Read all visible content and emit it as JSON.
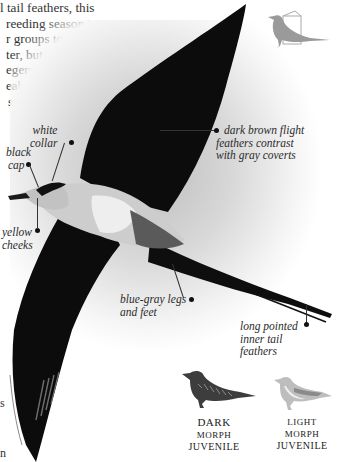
{
  "intro_text": {
    "lines": [
      "l tail feathers, this",
      "reeding season in",
      "r groups to the",
      "ter, but their",
      "egers, it is",
      "eabirds",
      "small"
    ]
  },
  "edge_fragments": [
    "s",
    "n"
  ],
  "annotations": {
    "white_collar": [
      "white",
      "collar"
    ],
    "black_cap": [
      "black",
      "cap"
    ],
    "yellow_cheeks": [
      "yellow",
      "cheeks"
    ],
    "flight_feathers": [
      "dark brown flight",
      "feathers contrast",
      "with gray coverts"
    ],
    "legs": [
      "blue-gray legs",
      "and feet"
    ],
    "tail": [
      "long pointed",
      "inner tail",
      "feathers"
    ]
  },
  "morphs": [
    {
      "line1": "Dark",
      "line2": "morph",
      "line3": "Juvenile"
    },
    {
      "line1": "light",
      "line2": "morph",
      "line3": "Juvenile"
    }
  ],
  "icons": {
    "habitat_silhouette": "seabird-silhouette-icon"
  },
  "colors": {
    "bird_dark": "#0d0d0d",
    "bird_body": "#cfcfcf",
    "background_glow": "#bdbdbd",
    "silhouette_gray": "#9a9a9a"
  }
}
